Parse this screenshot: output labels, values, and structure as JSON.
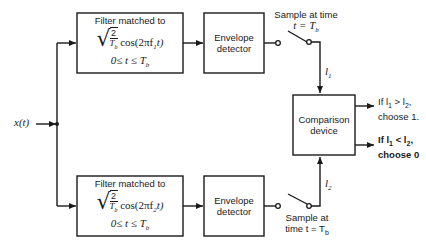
{
  "input": {
    "label": "x(t)"
  },
  "filter_top": {
    "title": "Filter matched to",
    "coef_num": "2",
    "coef_den": "T",
    "coef_den_sub": "b",
    "func": "cos(2πf",
    "func_sub": "1",
    "func_tail": "t)",
    "range": "0≤ t ≤ T",
    "range_sub": "b"
  },
  "filter_bottom": {
    "title": "Filter matched to",
    "coef_num": "2",
    "coef_den": "T",
    "coef_den_sub": "b",
    "func": "cos(2πf",
    "func_sub": "2",
    "func_tail": "t)",
    "range": "0≤ t ≤ T",
    "range_sub": "b"
  },
  "envelope_top": {
    "line1": "Envelope",
    "line2": "detector"
  },
  "envelope_bottom": {
    "line1": "Envelope",
    "line2": "detector"
  },
  "sampler_top": {
    "line1": "Sample at time",
    "line2": "t = T",
    "line2_sub": "b"
  },
  "sampler_bottom": {
    "line1": "Sample at",
    "line2": "time t = T",
    "line2_sub": "b"
  },
  "signal_top": {
    "label": "l",
    "sub": "1"
  },
  "signal_bottom": {
    "label": "l",
    "sub": "2"
  },
  "comparison": {
    "line1": "Comparison",
    "line2": "device"
  },
  "output_top": {
    "line1_pre": "If l",
    "line1_sub1": "1",
    "line1_op": " > l",
    "line1_sub2": "2",
    "line1_post": ",",
    "line2": "choose 1."
  },
  "output_bottom": {
    "line1_pre": "If l",
    "line1_sub1": "1",
    "line1_op": " < l",
    "line1_sub2": "2",
    "line1_post": ",",
    "line2": "choose 0"
  }
}
